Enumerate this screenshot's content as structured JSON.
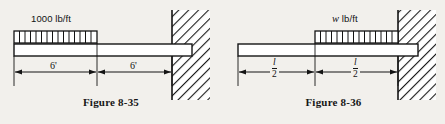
{
  "page": {
    "background_color": "#f2f0ec",
    "ink_color": "#161616"
  },
  "figures": [
    {
      "id": "figure-8-35",
      "caption": "Figure 8-35",
      "load_label": "1000 lb/ft",
      "load_label_italic_prefix": "",
      "load_position": "left-half",
      "dimensions": [
        {
          "label": "6'",
          "type": "plain"
        },
        {
          "label": "6'",
          "type": "plain"
        }
      ],
      "support": "fixed-wall-right",
      "load_divisions": 14
    },
    {
      "id": "figure-8-36",
      "caption": "Figure 8-36",
      "load_label": " lb/ft",
      "load_label_italic_prefix": "w",
      "load_position": "right-half",
      "dimensions": [
        {
          "label_numerator": "l",
          "label_denominator": "2",
          "type": "fraction"
        },
        {
          "label_numerator": "l",
          "label_denominator": "2",
          "type": "fraction"
        }
      ],
      "support": "fixed-wall-right",
      "load_divisions": 14
    }
  ]
}
